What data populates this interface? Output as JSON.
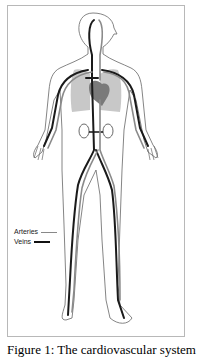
{
  "figure": {
    "legend": [
      {
        "label": "Arteries",
        "line_color": "#888888"
      },
      {
        "label": "Veins",
        "line_color": "#111111"
      }
    ],
    "caption": "Figure 1: The cardiovascular system",
    "colors": {
      "outline": "#555555",
      "lungs": "#c8c8c8",
      "heart": "#7a7a7a",
      "arteries": "#8a8a8a",
      "veins": "#1a1a1a",
      "border": "#b8b8b8"
    }
  }
}
